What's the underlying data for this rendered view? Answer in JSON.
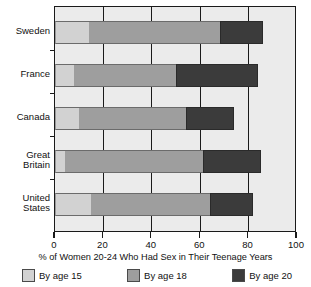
{
  "chart_data": {
    "type": "bar",
    "orientation": "horizontal",
    "stacked": false,
    "title": "",
    "xlabel": "% of Women 20-24 Who Had Sex in Their Teenage Years",
    "ylabel": "",
    "xlim": [
      0,
      100
    ],
    "xticks": [
      0,
      20,
      40,
      60,
      80,
      100
    ],
    "xticklabels": [
      "0",
      "20",
      "40",
      "60",
      "80",
      "100"
    ],
    "grid": true,
    "legend_position": "bottom",
    "categories": [
      "Sweden",
      "France",
      "Canada",
      "Great Britain",
      "United States"
    ],
    "series": [
      {
        "name": "By age 15",
        "color": "#d2d2d2",
        "values": [
          14,
          8,
          10,
          4,
          15
        ]
      },
      {
        "name": "By age 18",
        "color": "#9e9e9e",
        "values": [
          68,
          50,
          54,
          61,
          64
        ]
      },
      {
        "name": "By age 20",
        "color": "#3b3b3b",
        "values": [
          86,
          84,
          74,
          85,
          82
        ]
      }
    ]
  },
  "axis": {
    "title": "% of Women 20-24 Who Had Sex in Their Teenage Years",
    "ticks": [
      "0",
      "20",
      "40",
      "60",
      "80",
      "100"
    ]
  },
  "categories": [
    {
      "label": "Sweden"
    },
    {
      "label": "France"
    },
    {
      "label": "Canada"
    },
    {
      "label": "Great\nBritain"
    },
    {
      "label": "United\nStates"
    }
  ],
  "legend": [
    {
      "label": "By age 15",
      "color": "#d2d2d2"
    },
    {
      "label": "By age 18",
      "color": "#9e9e9e"
    },
    {
      "label": "By age 20",
      "color": "#3b3b3b"
    }
  ]
}
